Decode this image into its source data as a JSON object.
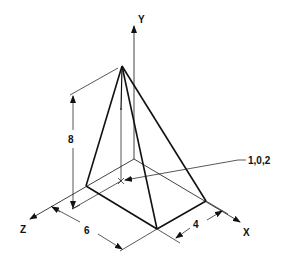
{
  "diagram": {
    "type": "isometric-pyramid",
    "axes": {
      "x_label": "X",
      "y_label": "Y",
      "z_label": "Z"
    },
    "dimensions": {
      "height": "8",
      "base_z": "6",
      "base_x": "4"
    },
    "annotation": {
      "point_label": "1,0,2"
    },
    "colors": {
      "line": "#111111",
      "background": "#ffffff"
    }
  }
}
